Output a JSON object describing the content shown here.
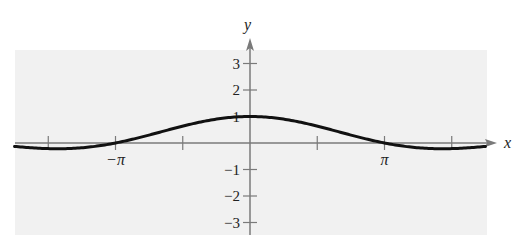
{
  "chart_data": {
    "type": "line",
    "title": "",
    "xlabel": "x",
    "ylabel": "y",
    "function": "y = sin(x)/x",
    "xlim": [
      -5.5,
      5.5
    ],
    "ylim": [
      -3.5,
      3.5
    ],
    "grid": false,
    "legend": null,
    "x_ticks": [
      {
        "value": -4.712,
        "label": ""
      },
      {
        "value": -3.14159,
        "label": "−π"
      },
      {
        "value": -1.5708,
        "label": ""
      },
      {
        "value": 1.5708,
        "label": ""
      },
      {
        "value": 3.14159,
        "label": "π"
      },
      {
        "value": 4.712,
        "label": ""
      }
    ],
    "y_ticks": [
      {
        "value": 3,
        "label": "3"
      },
      {
        "value": 2,
        "label": "2"
      },
      {
        "value": 1,
        "label": "1"
      },
      {
        "value": -1,
        "label": "−1"
      },
      {
        "value": -2,
        "label": "−2"
      },
      {
        "value": -3,
        "label": "−3"
      }
    ],
    "series": [
      {
        "name": "f(x)",
        "x": [
          -5.5,
          -5.0,
          -4.4934,
          -4.0,
          -3.5,
          -3.14159,
          -2.5,
          -2.0,
          -1.5,
          -1.0,
          -0.5,
          0,
          0.5,
          1.0,
          1.5,
          2.0,
          2.5,
          3.14159,
          3.5,
          4.0,
          4.4934,
          5.0,
          5.5
        ],
        "y": [
          -0.128,
          -0.192,
          -0.217,
          -0.189,
          -0.1,
          0.0,
          0.239,
          0.455,
          0.665,
          0.841,
          0.959,
          1.0,
          0.959,
          0.841,
          0.665,
          0.455,
          0.239,
          0.0,
          -0.1,
          -0.189,
          -0.217,
          -0.192,
          -0.128
        ]
      }
    ],
    "colors": {
      "background": "#ffffff",
      "plot_area": "#f1f1f1",
      "axis": "#7a7a7a",
      "curve": "#111111"
    }
  }
}
